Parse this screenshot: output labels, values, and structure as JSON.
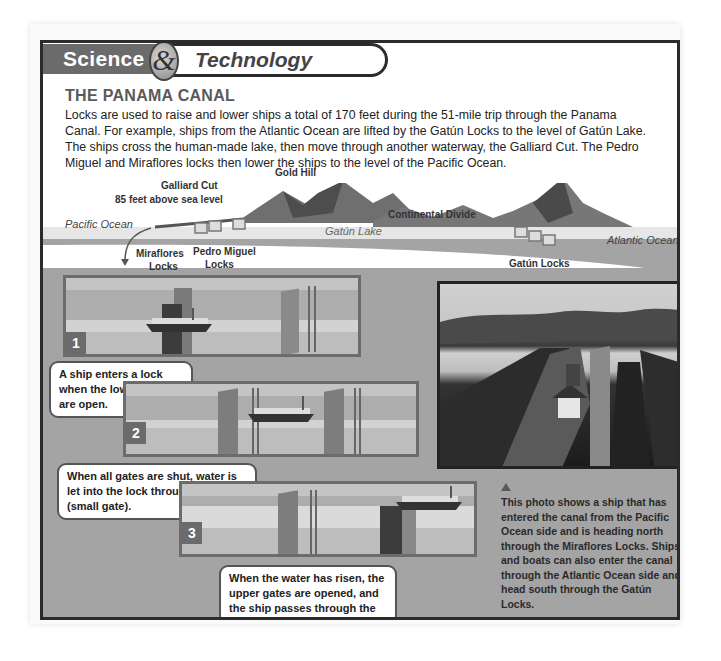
{
  "header": {
    "science_label": "Science",
    "ampersand": "&",
    "technology_label": "Technology"
  },
  "article": {
    "title": "THE PANAMA CANAL",
    "intro": "Locks are used to raise and lower ships a total of 170 feet during the 51-mile trip through the Panama Canal. For example, ships from the Atlantic Ocean are lifted by the Gatún Locks to the level of Gatún Lake. The ships cross the human-made lake, then move through another waterway, the Galliard Cut. The Pedro Miguel and Miraflores locks then lower the ships to the level of the Pacific Ocean."
  },
  "profile_diagram": {
    "labels": {
      "gold_hill": "Gold Hill",
      "galliard_cut": "Galliard Cut",
      "galliard_height": "85 feet above sea level",
      "pacific_ocean": "Pacific Ocean",
      "gatun_lake": "Gatún Lake",
      "continental_divide": "Continental Divide",
      "atlantic_ocean": "Atlantic Ocean",
      "miraflores_locks_1": "Miraflores",
      "miraflores_locks_2": "Locks",
      "pedro_miguel_locks_1": "Pedro Miguel",
      "pedro_miguel_locks_2": "Locks",
      "gatun_locks": "Gatún Locks"
    }
  },
  "steps": [
    {
      "number": "1",
      "caption": "A ship enters a lock when the lower gates are open."
    },
    {
      "number": "2",
      "caption": "When all gates are shut, water is let into the lock through a sluice (small gate)."
    },
    {
      "number": "3",
      "caption": "When the water has risen, the upper gates are opened, and the ship passes through the lock to the next level."
    }
  ],
  "photo": {
    "caption": "This photo shows a ship that has entered the canal from the Pacific Ocean side and is heading north through the Miraflores Locks. Ships and boats can also enter the canal through the Atlantic Ocean side and head south through the Gatún Locks."
  }
}
